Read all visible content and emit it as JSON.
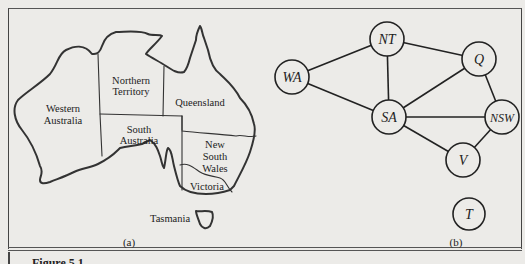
{
  "figure": {
    "caption": "Figure 5.1",
    "panel_a": {
      "label": "(a)",
      "regions": [
        {
          "id": "wa",
          "lines": [
            "Western",
            "Australia"
          ]
        },
        {
          "id": "nt",
          "lines": [
            "Northern",
            "Territory"
          ]
        },
        {
          "id": "q",
          "lines": [
            "Queensland"
          ]
        },
        {
          "id": "sa",
          "lines": [
            "South",
            "Australia"
          ]
        },
        {
          "id": "nsw",
          "lines": [
            "New",
            "South",
            "Wales"
          ]
        },
        {
          "id": "v",
          "lines": [
            "Victoria"
          ]
        },
        {
          "id": "t",
          "lines": [
            "Tasmania"
          ]
        }
      ]
    },
    "panel_b": {
      "label": "(b)",
      "nodes": [
        {
          "id": "NT",
          "label": "NT"
        },
        {
          "id": "Q",
          "label": "Q"
        },
        {
          "id": "WA",
          "label": "WA"
        },
        {
          "id": "SA",
          "label": "SA"
        },
        {
          "id": "NSW",
          "label": "NSW"
        },
        {
          "id": "V",
          "label": "V"
        },
        {
          "id": "T",
          "label": "T"
        }
      ],
      "edges": [
        [
          "WA",
          "NT"
        ],
        [
          "WA",
          "SA"
        ],
        [
          "NT",
          "SA"
        ],
        [
          "NT",
          "Q"
        ],
        [
          "SA",
          "Q"
        ],
        [
          "SA",
          "NSW"
        ],
        [
          "SA",
          "V"
        ],
        [
          "Q",
          "NSW"
        ],
        [
          "NSW",
          "V"
        ]
      ]
    }
  }
}
